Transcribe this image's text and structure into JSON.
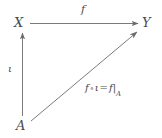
{
  "diagram": {
    "kind": "commutative-diagram",
    "background_color": "#ffffff",
    "stroke_color": "#6b6b6b",
    "text_color": "#4a4a4a",
    "objects": [
      {
        "id": "X",
        "label": "X",
        "position": "top-left"
      },
      {
        "id": "Y",
        "label": "Y",
        "position": "top-right"
      },
      {
        "id": "A",
        "label": "A",
        "position": "bottom-left"
      }
    ],
    "arrows": [
      {
        "id": "f",
        "from": "X",
        "to": "Y",
        "label": "f",
        "orientation": "horizontal",
        "label_position": "above"
      },
      {
        "id": "iota",
        "from": "A",
        "to": "X",
        "label": "ι",
        "orientation": "vertical-up",
        "label_position": "left"
      },
      {
        "id": "composite",
        "from": "A",
        "to": "Y",
        "orientation": "diagonal",
        "label_position": "right",
        "label_parts": {
          "f_first": "f",
          "circ": "∘",
          "iota": "ι",
          "equals": "=",
          "f_second": "f",
          "restriction_bar": "|",
          "subscript": "A"
        },
        "label_plain": "f ∘ ι = f|A"
      }
    ]
  }
}
